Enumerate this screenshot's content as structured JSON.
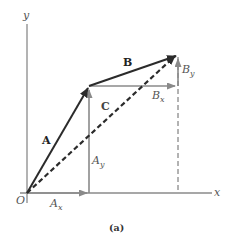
{
  "figure": {
    "caption": "(a)",
    "axes": {
      "x_label": "x",
      "y_label": "y",
      "origin_label": "O"
    },
    "vectors": {
      "A": {
        "label": "A",
        "from": [
          0,
          0
        ],
        "to": [
          62,
          107
        ],
        "style": "solid-dark"
      },
      "B": {
        "label": "B",
        "from": [
          62,
          107
        ],
        "to": [
          151,
          138
        ],
        "style": "solid-dark"
      },
      "C": {
        "label": "C",
        "from": [
          0,
          0
        ],
        "to": [
          151,
          138
        ],
        "style": "dashed-dark",
        "relation": "C = A + B"
      }
    },
    "components": {
      "Ax": {
        "label": "A",
        "subscript": "x"
      },
      "Ay": {
        "label": "A",
        "subscript": "y"
      },
      "Bx": {
        "label": "B",
        "subscript": "x"
      },
      "By": {
        "label": "B",
        "subscript": "y"
      }
    },
    "colors": {
      "vector": "#2b2b2b",
      "component": "#8a8a8a",
      "axis": "#8a8a8a",
      "label": "#555555"
    }
  }
}
